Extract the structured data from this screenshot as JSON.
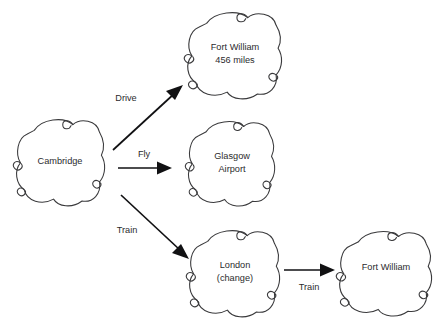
{
  "diagram": {
    "background_color": "#ffffff",
    "node_outline_color": "#3a3a3c",
    "edge_color": "#111113",
    "text_color": "#2b2b2d",
    "node_shape": "cloud",
    "nodes": [
      {
        "id": "cambridge",
        "shape_name": "cloud-shape",
        "lines": [
          "Cambridge"
        ],
        "x": 60,
        "y": 161,
        "w": 92,
        "h": 88
      },
      {
        "id": "fort-william-drive",
        "shape_name": "cloud-shape",
        "lines": [
          "Fort William",
          "456 miles"
        ],
        "x": 234,
        "y": 54,
        "w": 98,
        "h": 88
      },
      {
        "id": "glasgow-airport",
        "shape_name": "cloud-shape",
        "lines": [
          "Glasgow",
          "Airport"
        ],
        "x": 231,
        "y": 162,
        "w": 90,
        "h": 86
      },
      {
        "id": "london-change",
        "shape_name": "cloud-shape",
        "lines": [
          "London",
          "(change)"
        ],
        "x": 234,
        "y": 272,
        "w": 94,
        "h": 88
      },
      {
        "id": "fort-william-train",
        "shape_name": "cloud-shape",
        "lines": [
          "Fort William"
        ],
        "x": 385,
        "y": 272,
        "w": 96,
        "h": 86
      }
    ],
    "edges": [
      {
        "id": "drive-edge",
        "label": "Drive",
        "from": "cambridge",
        "to": "fort-william-drive",
        "x1": 113,
        "y1": 150,
        "x2": 181,
        "y2": 88,
        "label_x": 126,
        "label_y": 99
      },
      {
        "id": "fly-edge",
        "label": "Fly",
        "from": "cambridge",
        "to": "glasgow-airport",
        "x1": 118,
        "y1": 168,
        "x2": 170,
        "y2": 168,
        "label_x": 144,
        "label_y": 155
      },
      {
        "id": "train-edge",
        "label": "Train",
        "from": "cambridge",
        "to": "london-change",
        "x1": 121,
        "y1": 195,
        "x2": 187,
        "y2": 257,
        "label_x": 127,
        "label_y": 231
      },
      {
        "id": "train-edge-2",
        "label": "Train",
        "from": "london-change",
        "to": "fort-william-train",
        "x1": 284,
        "y1": 270,
        "x2": 334,
        "y2": 270,
        "label_x": 309,
        "label_y": 288
      }
    ]
  }
}
